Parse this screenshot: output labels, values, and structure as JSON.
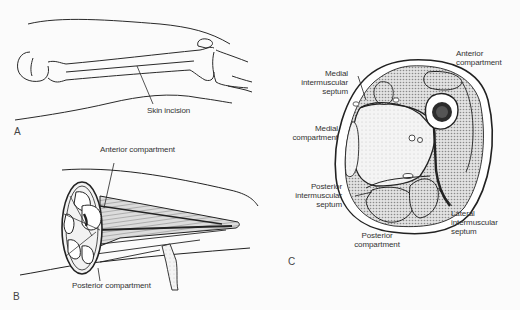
{
  "figure": {
    "panels": [
      {
        "id": "A",
        "letter": "A",
        "description": "Lateral view of thigh with femur outline and skin incision line",
        "labels": {
          "skin_incision": "Skin incision"
        }
      },
      {
        "id": "B",
        "letter": "B",
        "description": "Opened thigh showing compartments in oblique section",
        "labels": {
          "anterior_compartment": "Anterior compartment",
          "posterior_compartment": "Posterior compartment"
        }
      },
      {
        "id": "C",
        "letter": "C",
        "description": "Cross-section of thigh showing three compartments and intermuscular septa",
        "labels": {
          "anterior_compartment_l1": "Anterior",
          "anterior_compartment_l2": "compartment",
          "medial_septum_l1": "Medial",
          "medial_septum_l2": "intermuscular",
          "medial_septum_l3": "septum",
          "medial_compartment_l1": "Medial",
          "medial_compartment_l2": "compartment",
          "posterior_septum_l1": "Posterior",
          "posterior_septum_l2": "intermuscular",
          "posterior_septum_l3": "septum",
          "posterior_compartment_l1": "Posterior",
          "posterior_compartment_l2": "compartment",
          "lateral_septum_l1": "Lateral",
          "lateral_septum_l2": "intermuscular",
          "lateral_septum_l3": "septum"
        }
      }
    ],
    "colors": {
      "ink": "#222222",
      "shade": "#9a9a9a",
      "paper": "#fbfbfb"
    }
  }
}
